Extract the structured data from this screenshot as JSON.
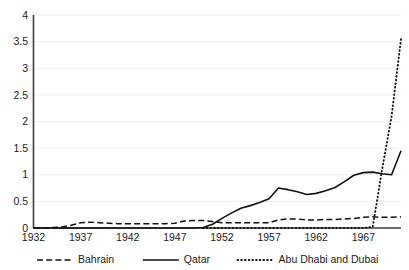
{
  "chart_data": {
    "type": "line",
    "title": "",
    "subtitle": "",
    "xlabel": "",
    "ylabel": "",
    "xlim": [
      1932,
      1971
    ],
    "ylim": [
      0,
      4
    ],
    "grid": true,
    "grid_axis": "y",
    "legend_position": "bottom",
    "y_ticks": [
      0,
      0.5,
      1,
      1.5,
      2,
      2.5,
      3,
      3.5,
      4
    ],
    "y_tick_labels": [
      "0",
      "0.5",
      "1",
      "1.5",
      "2",
      "2.5",
      "3",
      "3.5",
      "4"
    ],
    "x_ticks": [
      1932,
      1937,
      1942,
      1947,
      1952,
      1957,
      1962,
      1967
    ],
    "x_tick_labels": [
      "1932",
      "1937",
      "1942",
      "1947",
      "1952",
      "1957",
      "1962",
      "1967"
    ],
    "x": [
      1932,
      1933,
      1934,
      1935,
      1936,
      1937,
      1938,
      1939,
      1940,
      1941,
      1942,
      1943,
      1944,
      1945,
      1946,
      1947,
      1948,
      1949,
      1950,
      1951,
      1952,
      1953,
      1954,
      1955,
      1956,
      1957,
      1958,
      1959,
      1960,
      1961,
      1962,
      1963,
      1964,
      1965,
      1966,
      1967,
      1968,
      1969,
      1970,
      1971
    ],
    "series": [
      {
        "name": "Bahrain",
        "style": "dashed",
        "color": "#111111",
        "values": [
          0,
          0,
          0.01,
          0.02,
          0.05,
          0.1,
          0.11,
          0.1,
          0.09,
          0.08,
          0.08,
          0.08,
          0.08,
          0.08,
          0.08,
          0.09,
          0.13,
          0.14,
          0.14,
          0.12,
          0.1,
          0.1,
          0.1,
          0.1,
          0.1,
          0.1,
          0.15,
          0.17,
          0.17,
          0.15,
          0.15,
          0.16,
          0.16,
          0.17,
          0.18,
          0.2,
          0.21,
          0.2,
          0.2,
          0.21
        ]
      },
      {
        "name": "Qatar",
        "style": "solid",
        "color": "#111111",
        "values": [
          0,
          0,
          0,
          0,
          0,
          0,
          0,
          0,
          0,
          0,
          0,
          0,
          0,
          0,
          0,
          0,
          0,
          0,
          0.01,
          0.07,
          0.18,
          0.28,
          0.37,
          0.42,
          0.48,
          0.55,
          0.75,
          0.72,
          0.68,
          0.63,
          0.65,
          0.7,
          0.76,
          0.87,
          0.99,
          1.04,
          1.05,
          1.02,
          1.0,
          1.45
        ]
      },
      {
        "name": "Abu Dhabi and Dubai",
        "style": "dotted",
        "color": "#111111",
        "values": [
          null,
          null,
          null,
          null,
          null,
          null,
          null,
          null,
          null,
          null,
          null,
          null,
          null,
          null,
          null,
          null,
          null,
          null,
          0,
          0,
          0,
          0,
          0,
          0,
          0,
          0,
          0,
          0,
          0,
          0,
          0,
          0,
          0,
          0,
          0,
          0,
          0.02,
          1.1,
          2.1,
          3.55
        ]
      }
    ]
  },
  "legend": {
    "items": [
      {
        "label": "Bahrain",
        "style": "dashed"
      },
      {
        "label": "Qatar",
        "style": "solid"
      },
      {
        "label": "Abu Dhabi and Dubai",
        "style": "dotted"
      }
    ]
  }
}
